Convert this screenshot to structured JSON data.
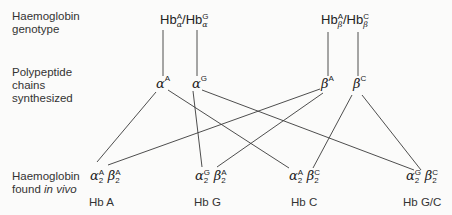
{
  "row_labels": {
    "genotype": [
      "Haemoglobin",
      "genotype"
    ],
    "chains": [
      "Polypeptide",
      "chains",
      "synthesized"
    ],
    "found": [
      "Haemoglobin",
      "found",
      "in vivo"
    ]
  },
  "genotypes": [
    {
      "prefix": "Hb",
      "chain": "α",
      "allele1": "A",
      "sep": "/Hb",
      "allele2": "G"
    },
    {
      "prefix": "Hb",
      "chain": "β",
      "allele1": "A",
      "sep": "/Hb",
      "allele2": "C"
    }
  ],
  "chains": [
    {
      "symbol": "α",
      "allele": "A"
    },
    {
      "symbol": "α",
      "allele": "G"
    },
    {
      "symbol": "β",
      "allele": "A"
    },
    {
      "symbol": "β",
      "allele": "C"
    }
  ],
  "haemoglobins": [
    {
      "alpha": "α",
      "alpha_allele": "A",
      "beta": "β",
      "beta_allele": "A",
      "count": "2",
      "name": "Hb  A"
    },
    {
      "alpha": "α",
      "alpha_allele": "G",
      "beta": "β",
      "beta_allele": "A",
      "count": "2",
      "name": "Hb  G"
    },
    {
      "alpha": "α",
      "alpha_allele": "A",
      "beta": "β",
      "beta_allele": "C",
      "count": "2",
      "name": "Hb  C"
    },
    {
      "alpha": "α",
      "alpha_allele": "G",
      "beta": "β",
      "beta_allele": "C",
      "count": "2",
      "name": "Hb  G/C"
    }
  ],
  "connections": [
    {
      "from": "genotype-alpha",
      "to": "chain-alpha-A"
    },
    {
      "from": "genotype-alpha",
      "to": "chain-alpha-G"
    },
    {
      "from": "genotype-beta",
      "to": "chain-beta-A"
    },
    {
      "from": "genotype-beta",
      "to": "chain-beta-C"
    },
    {
      "from": "chain-alpha-A",
      "to": "Hb A"
    },
    {
      "from": "chain-alpha-A",
      "to": "Hb C"
    },
    {
      "from": "chain-alpha-G",
      "to": "Hb G"
    },
    {
      "from": "chain-alpha-G",
      "to": "Hb G/C"
    },
    {
      "from": "chain-beta-A",
      "to": "Hb A"
    },
    {
      "from": "chain-beta-A",
      "to": "Hb G"
    },
    {
      "from": "chain-beta-C",
      "to": "Hb C"
    },
    {
      "from": "chain-beta-C",
      "to": "Hb G/C"
    }
  ],
  "colors": {
    "line": "#3a3a3a",
    "text": "#2a2a2a",
    "background": "#fbfbfa"
  }
}
